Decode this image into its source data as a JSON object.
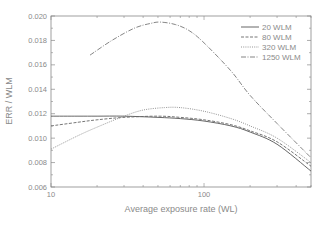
{
  "chart_data": {
    "type": "line",
    "title": "",
    "xlabel": "Average exposure rate (WL)",
    "ylabel": "ERR / WLM",
    "xscale": "log",
    "xlim": [
      10,
      500
    ],
    "ylim": [
      0.006,
      0.02
    ],
    "x_tick_labels": [
      "10",
      "100"
    ],
    "y_tick_labels": [
      "0.006",
      "0.008",
      "0.010",
      "0.012",
      "0.014",
      "0.016",
      "0.018",
      "0.020"
    ],
    "grid": false,
    "legend_position": "upper right",
    "series": [
      {
        "name": "20 WLM",
        "style": "solid",
        "color": "#555555",
        "x": [
          10,
          15,
          20,
          30,
          50,
          70,
          100,
          150,
          200,
          300,
          500
        ],
        "y": [
          0.0118,
          0.0118,
          0.0118,
          0.0118,
          0.0117,
          0.0116,
          0.0114,
          0.011,
          0.0105,
          0.0095,
          0.0073
        ]
      },
      {
        "name": "80 WLM",
        "style": "dashed",
        "color": "#666666",
        "x": [
          10,
          15,
          20,
          30,
          50,
          70,
          100,
          150,
          200,
          300,
          500
        ],
        "y": [
          0.011,
          0.0113,
          0.0115,
          0.0117,
          0.0118,
          0.0117,
          0.0115,
          0.0111,
          0.0106,
          0.0097,
          0.0077
        ]
      },
      {
        "name": "320 WLM",
        "style": "dotted",
        "color": "#888888",
        "x": [
          10,
          15,
          20,
          30,
          40,
          55,
          70,
          100,
          150,
          200,
          300,
          500
        ],
        "y": [
          0.0091,
          0.0102,
          0.0109,
          0.0118,
          0.0123,
          0.0125,
          0.0125,
          0.0122,
          0.0116,
          0.011,
          0.01,
          0.008
        ]
      },
      {
        "name": "1250 WLM",
        "style": "dash-dot",
        "color": "#777777",
        "x": [
          18,
          25,
          35,
          45,
          52,
          65,
          80,
          100,
          150,
          200,
          300,
          500
        ],
        "y": [
          0.0168,
          0.018,
          0.019,
          0.0194,
          0.0195,
          0.0193,
          0.0188,
          0.0178,
          0.0155,
          0.0135,
          0.0112,
          0.0084
        ]
      }
    ]
  }
}
